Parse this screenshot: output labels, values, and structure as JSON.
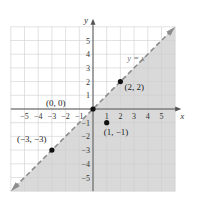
{
  "chart_data": {
    "type": "line",
    "title": "",
    "xlabel": "x",
    "ylabel": "y",
    "xlim": [
      -6,
      6
    ],
    "ylim": [
      -6,
      6
    ],
    "grid": true,
    "x_ticks": [
      -5,
      -4,
      -3,
      -2,
      -1,
      1,
      2,
      3,
      4,
      5
    ],
    "y_ticks": [
      -5,
      -4,
      -3,
      -2,
      -1,
      1,
      2,
      3,
      4,
      5
    ],
    "x_tick_labels": [
      "−5",
      "−4",
      "−3",
      "−2",
      "−1",
      "1",
      "2",
      "3",
      "4",
      "5"
    ],
    "y_tick_labels": [
      "−5",
      "−4",
      "−3",
      "−2",
      "−1",
      "1",
      "2",
      "3",
      "4",
      "5"
    ],
    "series": [
      {
        "name": "y = x",
        "style": "dashed",
        "x": [
          -6,
          6
        ],
        "y": [
          -6,
          6
        ]
      }
    ],
    "shaded_region": "below line y = x (y < x)",
    "points": [
      {
        "x": 0,
        "y": 0,
        "label": "(0, 0)"
      },
      {
        "x": 2,
        "y": 2,
        "label": "(2, 2)"
      },
      {
        "x": 1,
        "y": -1,
        "label": "(1, −1)"
      },
      {
        "x": -3,
        "y": -3,
        "label": "(−3, −3)"
      }
    ],
    "annotations": [
      {
        "text": "y = x",
        "x": 2.5,
        "y": 3.5
      }
    ]
  },
  "colors": {
    "shade": "#d9d9d9",
    "grid": "#cfcfcf",
    "line": "#8c8c8c",
    "axis": "#555555",
    "point": "#111111"
  }
}
